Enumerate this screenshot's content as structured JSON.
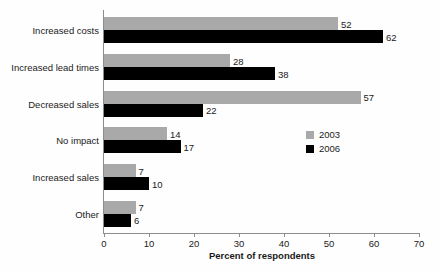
{
  "chart_data": {
    "type": "bar",
    "orientation": "horizontal",
    "title": "",
    "xlabel": "Percent of respondents",
    "ylabel": "",
    "xlim": [
      0,
      70
    ],
    "xticks": [
      0,
      10,
      20,
      30,
      40,
      50,
      60,
      70
    ],
    "grid": false,
    "legend_position": "middle-right",
    "categories": [
      "Increased costs",
      "Increased lead times",
      "Decreased sales",
      "No impact",
      "Increased sales",
      "Other"
    ],
    "series": [
      {
        "name": "2003",
        "color": "#a9a9a9",
        "values": [
          52,
          28,
          57,
          14,
          7,
          7
        ]
      },
      {
        "name": "2006",
        "color": "#000000",
        "values": [
          62,
          38,
          22,
          17,
          10,
          6
        ]
      }
    ]
  }
}
